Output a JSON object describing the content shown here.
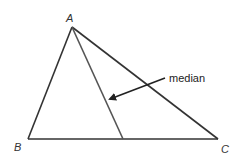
{
  "diagram": {
    "vertices": [
      {
        "label": "A",
        "x": 72,
        "y": 27
      },
      {
        "label": "B",
        "x": 28,
        "y": 139
      },
      {
        "label": "C",
        "x": 218,
        "y": 139
      }
    ],
    "median": {
      "from": "A",
      "to_midpoint_of": "BC",
      "foot": {
        "x": 123,
        "y": 139
      }
    },
    "annotation": {
      "text": "median",
      "arrow_from": {
        "x": 165,
        "y": 78
      },
      "arrow_to": {
        "x": 108,
        "y": 100
      }
    },
    "colors": {
      "stroke": "#333333",
      "median_stroke": "#555555",
      "text": "#222222"
    }
  }
}
